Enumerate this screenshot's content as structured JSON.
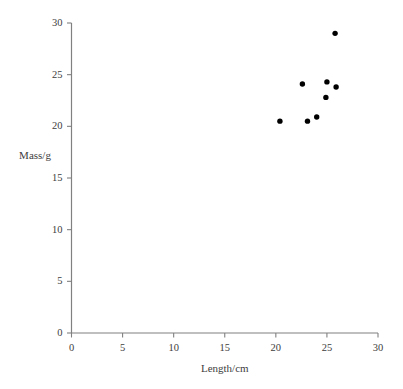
{
  "chart_data": {
    "type": "scatter",
    "title": "",
    "xlabel": "Length/cm",
    "ylabel": "Mass/g",
    "xlim": [
      0,
      30
    ],
    "ylim": [
      0,
      30
    ],
    "xticks": [
      0,
      5,
      10,
      15,
      20,
      25,
      30
    ],
    "yticks": [
      0,
      5,
      10,
      15,
      20,
      25,
      30
    ],
    "xtick_labels": [
      "0",
      "5",
      "10",
      "15",
      "20",
      "25",
      "30"
    ],
    "ytick_labels": [
      "0",
      "5",
      "10",
      "15",
      "20",
      "25",
      "30"
    ],
    "grid": false,
    "legend": null,
    "marker": "filled-circle",
    "marker_color": "#000000",
    "axis_color": "#808080",
    "points": [
      {
        "x": 20.4,
        "y": 20.5
      },
      {
        "x": 22.6,
        "y": 24.1
      },
      {
        "x": 23.1,
        "y": 20.5
      },
      {
        "x": 24.0,
        "y": 20.9
      },
      {
        "x": 24.9,
        "y": 22.8
      },
      {
        "x": 25.0,
        "y": 24.3
      },
      {
        "x": 25.8,
        "y": 29.0
      },
      {
        "x": 25.9,
        "y": 23.8
      }
    ]
  }
}
